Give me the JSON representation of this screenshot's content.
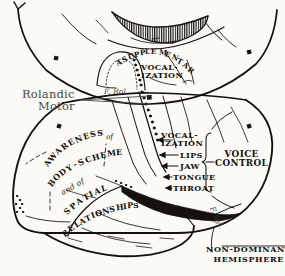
{
  "figure": {
    "type": "anatomical-line-diagram",
    "background_color": "#fbfaf7",
    "ink_color": "#15120e",
    "script_label_color": "#4a4a46"
  },
  "labels": {
    "rolandic_motor_line1": "Rolandic",
    "rolandic_motor_line2": "Motor",
    "supplementary": "SUPPLEMENTARY",
    "supplementary_vocal_1": "VOCAL-",
    "supplementary_vocal_2": "IZATION",
    "vocalization_1": "VOCAL-",
    "vocalization_2": "IZATION",
    "lips": "LIPS",
    "jaw": "JAW",
    "tongue": "TONGUE",
    "throat": "THROAT",
    "voice_line1": "VOICE",
    "voice_line2": "CONTROL",
    "hemisphere_line1": "NON-DOMINANT",
    "hemisphere_line2": "HEMISPHERE",
    "fissure_rolando": "F. Rol.",
    "fissure_sylvian": "F. Syl."
  },
  "arc_labels": {
    "awareness": {
      "text": "AWARENESS",
      "letters": [
        "A",
        "W",
        "A",
        "R",
        "E",
        "N",
        "E",
        "S",
        "S"
      ]
    },
    "of_1": {
      "text": "of"
    },
    "body_scheme": {
      "text": "BODY-SCHEME",
      "letters": [
        "B",
        "O",
        "D",
        "Y",
        "-",
        "S",
        "C",
        "H",
        "E",
        "M",
        "E"
      ]
    },
    "and_of": {
      "text": "and of"
    },
    "spatial": {
      "text": "SPATIAL",
      "letters": [
        "S",
        "P",
        "A",
        "T",
        "I",
        "A",
        "L"
      ]
    },
    "relationships": {
      "text": "RELATIONSHIPS",
      "letters": [
        "R",
        "E",
        "L",
        "A",
        "T",
        "I",
        "O",
        "N",
        "S",
        "H",
        "I",
        "P",
        "S"
      ]
    }
  },
  "regions": [
    {
      "name": "medial-surface-upper",
      "description": "Upper medial view of hemisphere with hatched corpus callosum band"
    },
    {
      "name": "hatched-band",
      "description": "Vertically hatched crescent at top",
      "icon": "hatch-band-icon"
    },
    {
      "name": "supplementary-motor-area",
      "description": "Dome shaped dotted region on medial surface"
    },
    {
      "name": "lateral-surface-lower",
      "description": "Lateral view of non-dominant hemisphere"
    },
    {
      "name": "sylvian-fissure",
      "description": "Dark wedge marking the Sylvian fissure"
    },
    {
      "name": "temporal-lobe",
      "description": "Lower temporal lobe outline"
    },
    {
      "name": "occipital-pole",
      "description": "Stippled occipital pole at left"
    }
  ],
  "markers": {
    "square_marker_count": 4,
    "description": "Small filled black squares placed along hemisphere outlines"
  },
  "arrows": {
    "count": 5,
    "description": "Short leader arrows pointing left from the motor strip labels"
  }
}
